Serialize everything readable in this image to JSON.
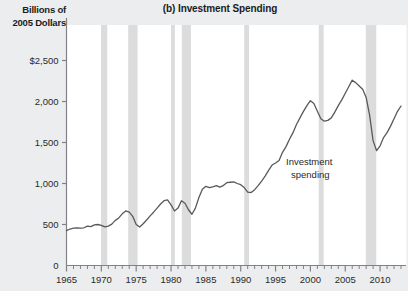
{
  "figure": {
    "title": "(b) Investment Spending",
    "y_axis_title_line1": "Billions of",
    "y_axis_title_line2": "2005 Dollars",
    "background_color": "#ecedee",
    "plot_background_color": "#ffffff",
    "line_color": "#58595b",
    "recession_band_color": "#dcdcdc",
    "axis_color": "#808285"
  },
  "chart_data": {
    "type": "line",
    "title": "(b) Investment Spending",
    "subtitle": "",
    "xlabel": "",
    "ylabel": "Billions of 2005 Dollars",
    "xlim": [
      1965,
      2013
    ],
    "ylim": [
      0,
      2750
    ],
    "grid": false,
    "legend_position": "inline-annotation",
    "y_ticks": [
      0,
      500,
      1000,
      1500,
      2000,
      2500
    ],
    "y_tick_labels": [
      "0",
      "500",
      "1,000",
      "1,500",
      "2,000",
      "$2,500"
    ],
    "x_ticks": [
      1965,
      1970,
      1975,
      1980,
      1985,
      1990,
      1995,
      2000,
      2005,
      2010
    ],
    "x_tick_labels": [
      "1965",
      "1970",
      "1975",
      "1980",
      "1985",
      "1990",
      "1995",
      "2000",
      "2005",
      "2010"
    ],
    "x_minor_tick_interval": 1,
    "annotations": [
      {
        "text_line1": "Investment",
        "text_line2": "spending",
        "x": 1996.5,
        "y": 1230
      }
    ],
    "recession_bands": [
      {
        "start": 1969.95,
        "end": 1970.85
      },
      {
        "start": 1973.85,
        "end": 1975.2
      },
      {
        "start": 1980.0,
        "end": 1980.55
      },
      {
        "start": 1981.55,
        "end": 1982.85
      },
      {
        "start": 1990.5,
        "end": 1991.2
      },
      {
        "start": 2001.2,
        "end": 2001.9
      },
      {
        "start": 2007.95,
        "end": 2009.45
      }
    ],
    "series": [
      {
        "name": "Investment spending",
        "color": "#58595b",
        "x": [
          1965.0,
          1965.5,
          1966.0,
          1966.5,
          1967.0,
          1967.5,
          1968.0,
          1968.5,
          1969.0,
          1969.5,
          1970.0,
          1970.5,
          1971.0,
          1971.5,
          1972.0,
          1972.5,
          1973.0,
          1973.5,
          1974.0,
          1974.5,
          1975.0,
          1975.5,
          1976.0,
          1976.5,
          1977.0,
          1977.5,
          1978.0,
          1978.5,
          1979.0,
          1979.5,
          1980.0,
          1980.5,
          1981.0,
          1981.5,
          1982.0,
          1982.5,
          1983.0,
          1983.5,
          1984.0,
          1984.5,
          1985.0,
          1985.5,
          1986.0,
          1986.5,
          1987.0,
          1987.5,
          1988.0,
          1988.5,
          1989.0,
          1989.5,
          1990.0,
          1990.5,
          1991.0,
          1991.5,
          1992.0,
          1992.5,
          1993.0,
          1993.5,
          1994.0,
          1994.5,
          1995.0,
          1995.5,
          1996.0,
          1996.5,
          1997.0,
          1997.5,
          1998.0,
          1998.5,
          1999.0,
          1999.5,
          2000.0,
          2000.5,
          2001.0,
          2001.5,
          2002.0,
          2002.5,
          2003.0,
          2003.5,
          2004.0,
          2004.5,
          2005.0,
          2005.5,
          2006.0,
          2006.5,
          2007.0,
          2007.5,
          2008.0,
          2008.5,
          2009.0,
          2009.5,
          2010.0,
          2010.5,
          2011.0,
          2011.5,
          2012.0,
          2012.5,
          2013.0
        ],
        "y": [
          425,
          445,
          455,
          460,
          455,
          460,
          480,
          475,
          495,
          500,
          490,
          470,
          480,
          505,
          550,
          580,
          630,
          665,
          650,
          600,
          500,
          470,
          510,
          555,
          605,
          650,
          700,
          750,
          790,
          800,
          740,
          665,
          700,
          790,
          760,
          680,
          625,
          700,
          830,
          930,
          965,
          950,
          960,
          975,
          955,
          975,
          1010,
          1015,
          1020,
          1000,
          985,
          950,
          895,
          890,
          925,
          975,
          1030,
          1090,
          1160,
          1225,
          1250,
          1280,
          1380,
          1450,
          1540,
          1620,
          1720,
          1800,
          1880,
          1950,
          2010,
          1975,
          1880,
          1790,
          1760,
          1770,
          1800,
          1870,
          1950,
          2020,
          2100,
          2180,
          2260,
          2230,
          2190,
          2150,
          2050,
          1830,
          1520,
          1400,
          1460,
          1560,
          1620,
          1700,
          1790,
          1880,
          1945
        ]
      }
    ]
  }
}
